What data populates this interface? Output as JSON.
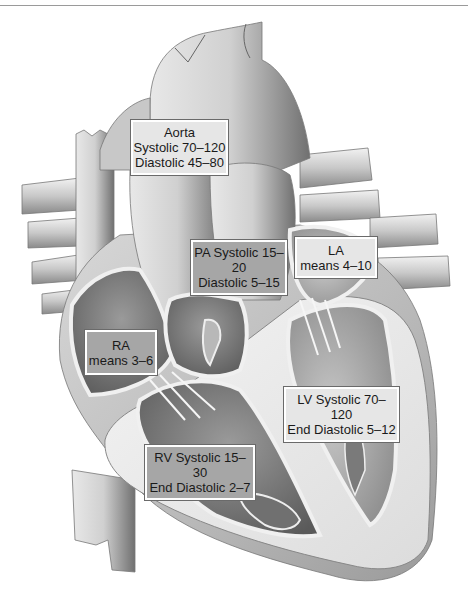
{
  "figure": {
    "colors": {
      "light_label_bg": "#e6e6e6",
      "dark_label_bg": "#a6a6a6",
      "label_border": "#ffffff",
      "text": "#1a1a1a"
    },
    "labels": {
      "aorta": {
        "line1": "Aorta",
        "line2": "Systolic 70–120",
        "line3": "Diastolic 45–80"
      },
      "pa": {
        "line1": "PA Systolic 15–",
        "line2": "20",
        "line3": "Diastolic 5–15"
      },
      "la": {
        "line1": "LA",
        "line2": "means 4–10"
      },
      "ra": {
        "line1": "RA",
        "line2": "means 3–6"
      },
      "lv": {
        "line1": "LV Systolic 70–",
        "line2": "120",
        "line3": "End Diastolic 5–12"
      },
      "rv": {
        "line1": "RV Systolic 15–",
        "line2": "30",
        "line3": "End Diastolic 2–7"
      }
    }
  }
}
